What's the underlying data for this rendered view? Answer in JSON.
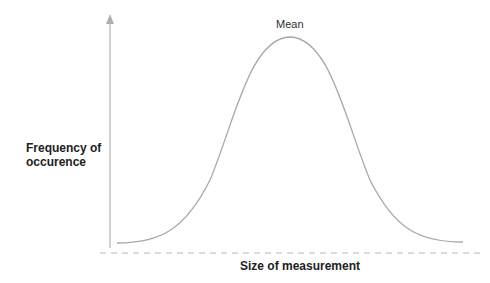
{
  "diagram": {
    "title_annotation": "Mean",
    "y_axis_label_line1": "Frequency of",
    "y_axis_label_line2": "occurence",
    "x_axis_label": "Size of measurement",
    "curve_type": "normal distribution (bell curve)",
    "colors": {
      "axis": "#b0b0b0",
      "curve": "#a8a8a8",
      "baseline": "#b8b8b8",
      "text": "#222222"
    }
  }
}
